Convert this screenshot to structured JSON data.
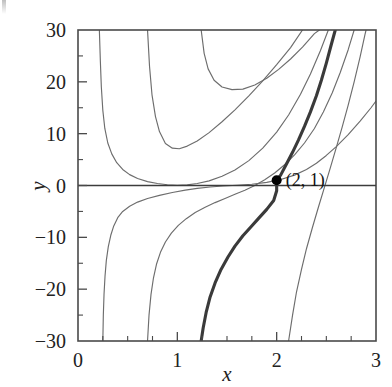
{
  "chart_data": {
    "type": "line",
    "title": "",
    "subtitle": "",
    "xlabel": "x",
    "ylabel": "y",
    "xlim": [
      0,
      3
    ],
    "ylim": [
      -30,
      30
    ],
    "grid": false,
    "legend": null,
    "x_ticks": [
      0,
      1,
      2,
      3
    ],
    "x_tick_labels": [
      "0",
      "1",
      "2",
      "3"
    ],
    "y_ticks": [
      -30,
      -20,
      -10,
      0,
      10,
      20,
      30
    ],
    "y_tick_labels": [
      "−30",
      "−20",
      "−10",
      "0",
      "10",
      "20",
      "30"
    ],
    "x_minor_ticks": [
      0.25,
      0.5,
      0.75,
      1.25,
      1.5,
      1.75,
      2.25,
      2.5,
      2.75
    ],
    "y_minor_ticks": [
      -25,
      -15,
      -5,
      5,
      15,
      25
    ],
    "zero_line": 0,
    "annotations": [
      {
        "text": "(2, 1)",
        "x": 2,
        "y": 1,
        "marker": "filled-circle"
      }
    ],
    "series": [
      {
        "name": "solution-curve-1",
        "emphasis": "normal",
        "points": [
          [
            0.215,
            30
          ],
          [
            0.225,
            24
          ],
          [
            0.235,
            19
          ],
          [
            0.25,
            14.5
          ],
          [
            0.27,
            11
          ],
          [
            0.3,
            8.2
          ],
          [
            0.34,
            6.1
          ],
          [
            0.39,
            4.4
          ],
          [
            0.45,
            3.1
          ],
          [
            0.52,
            2.1
          ],
          [
            0.6,
            1.35
          ],
          [
            0.7,
            0.75
          ],
          [
            0.8,
            0.38
          ],
          [
            0.9,
            0.15
          ],
          [
            1.0,
            0.05
          ],
          [
            1.1,
            0.12
          ],
          [
            1.2,
            0.38
          ],
          [
            1.32,
            0.9
          ],
          [
            1.45,
            1.8
          ],
          [
            1.58,
            3.0
          ],
          [
            1.72,
            4.8
          ],
          [
            1.86,
            7.2
          ],
          [
            2.0,
            10.3
          ],
          [
            2.12,
            13.6
          ],
          [
            2.24,
            17.6
          ],
          [
            2.34,
            21.5
          ],
          [
            2.44,
            26.0
          ],
          [
            2.52,
            30
          ]
        ]
      },
      {
        "name": "solution-curve-2",
        "emphasis": "normal",
        "points": [
          [
            0.7,
            30
          ],
          [
            0.72,
            23
          ],
          [
            0.745,
            17.5
          ],
          [
            0.78,
            13.3
          ],
          [
            0.82,
            10.4
          ],
          [
            0.88,
            8.1
          ],
          [
            0.95,
            7.2
          ],
          [
            1.02,
            7.1
          ],
          [
            1.1,
            7.6
          ],
          [
            1.2,
            8.6
          ],
          [
            1.32,
            10.2
          ],
          [
            1.45,
            12.3
          ],
          [
            1.58,
            14.6
          ],
          [
            1.72,
            17.3
          ],
          [
            1.86,
            20.2
          ],
          [
            2.0,
            23.3
          ],
          [
            2.14,
            26.6
          ],
          [
            2.26,
            30
          ]
        ]
      },
      {
        "name": "solution-curve-3",
        "emphasis": "normal",
        "points": [
          [
            1.24,
            30
          ],
          [
            1.27,
            25.5
          ],
          [
            1.31,
            22.5
          ],
          [
            1.37,
            20.3
          ],
          [
            1.45,
            19.0
          ],
          [
            1.55,
            18.5
          ],
          [
            1.66,
            18.6
          ],
          [
            1.78,
            19.4
          ],
          [
            1.9,
            20.7
          ],
          [
            2.02,
            22.4
          ],
          [
            2.14,
            24.4
          ],
          [
            2.26,
            26.7
          ],
          [
            2.38,
            29.3
          ],
          [
            2.43,
            30
          ]
        ]
      },
      {
        "name": "solution-curve-4",
        "emphasis": "normal",
        "points": [
          [
            0.25,
            -30
          ],
          [
            0.255,
            -25
          ],
          [
            0.262,
            -21
          ],
          [
            0.272,
            -17.5
          ],
          [
            0.285,
            -14.5
          ],
          [
            0.305,
            -11.8
          ],
          [
            0.33,
            -9.6
          ],
          [
            0.36,
            -7.8
          ],
          [
            0.4,
            -6.2
          ],
          [
            0.45,
            -5.0
          ],
          [
            0.52,
            -4.0
          ],
          [
            0.6,
            -3.2
          ],
          [
            0.7,
            -2.5
          ],
          [
            0.82,
            -1.9
          ],
          [
            0.95,
            -1.35
          ],
          [
            1.08,
            -0.9
          ],
          [
            1.2,
            -0.55
          ],
          [
            1.33,
            -0.28
          ],
          [
            1.46,
            -0.1
          ],
          [
            1.6,
            0.05
          ],
          [
            1.75,
            0.25
          ],
          [
            1.9,
            0.6
          ],
          [
            2.05,
            1.2
          ],
          [
            2.18,
            2.0
          ],
          [
            2.3,
            3.1
          ],
          [
            2.4,
            4.3
          ],
          [
            2.5,
            5.8
          ],
          [
            2.6,
            7.5
          ],
          [
            2.72,
            9.8
          ],
          [
            2.84,
            12.4
          ],
          [
            2.95,
            15.0
          ],
          [
            3.0,
            16.3
          ]
        ]
      },
      {
        "name": "solution-curve-5",
        "emphasis": "normal",
        "points": [
          [
            0.7,
            -30
          ],
          [
            0.715,
            -25
          ],
          [
            0.735,
            -21
          ],
          [
            0.76,
            -17.8
          ],
          [
            0.79,
            -15.2
          ],
          [
            0.83,
            -12.9
          ],
          [
            0.88,
            -10.9
          ],
          [
            0.94,
            -9.2
          ],
          [
            1.01,
            -7.7
          ],
          [
            1.09,
            -6.4
          ],
          [
            1.18,
            -5.2
          ],
          [
            1.28,
            -4.2
          ],
          [
            1.38,
            -3.3
          ],
          [
            1.48,
            -2.5
          ],
          [
            1.58,
            -1.7
          ],
          [
            1.68,
            -0.9
          ],
          [
            1.78,
            0.0
          ],
          [
            1.88,
            1.1
          ],
          [
            1.98,
            2.4
          ],
          [
            2.08,
            4.0
          ],
          [
            2.18,
            5.9
          ],
          [
            2.28,
            8.2
          ],
          [
            2.38,
            11.0
          ],
          [
            2.47,
            14.2
          ],
          [
            2.56,
            17.9
          ],
          [
            2.64,
            21.8
          ],
          [
            2.72,
            26.2
          ],
          [
            2.78,
            30
          ]
        ]
      },
      {
        "name": "solution-curve-6",
        "emphasis": "normal",
        "points": [
          [
            2.12,
            -30
          ],
          [
            2.16,
            -25
          ],
          [
            2.2,
            -20.5
          ],
          [
            2.25,
            -16.2
          ],
          [
            2.3,
            -12.2
          ],
          [
            2.36,
            -8.1
          ],
          [
            2.42,
            -4.2
          ],
          [
            2.48,
            -0.4
          ],
          [
            2.54,
            3.4
          ],
          [
            2.6,
            7.3
          ],
          [
            2.66,
            11.3
          ],
          [
            2.72,
            15.5
          ],
          [
            2.78,
            20.0
          ],
          [
            2.84,
            24.8
          ],
          [
            2.89,
            29.2
          ],
          [
            2.9,
            30
          ]
        ]
      },
      {
        "name": "solution-curve-through-point",
        "emphasis": "bold",
        "points": [
          [
            1.24,
            -30
          ],
          [
            1.26,
            -27.5
          ],
          [
            1.29,
            -24.5
          ],
          [
            1.33,
            -21.5
          ],
          [
            1.38,
            -18.8
          ],
          [
            1.44,
            -16.2
          ],
          [
            1.51,
            -13.8
          ],
          [
            1.58,
            -11.7
          ],
          [
            1.66,
            -9.7
          ],
          [
            1.74,
            -8.0
          ],
          [
            1.82,
            -6.3
          ],
          [
            1.9,
            -4.6
          ],
          [
            1.97,
            -2.9
          ],
          [
            2.0,
            -1.0
          ],
          [
            2.0,
            1.0
          ],
          [
            2.04,
            2.0
          ],
          [
            2.1,
            4.2
          ],
          [
            2.16,
            6.4
          ],
          [
            2.22,
            8.8
          ],
          [
            2.28,
            11.4
          ],
          [
            2.34,
            14.2
          ],
          [
            2.4,
            17.3
          ],
          [
            2.45,
            20.3
          ],
          [
            2.5,
            23.6
          ],
          [
            2.55,
            27.2
          ],
          [
            2.59,
            30
          ]
        ]
      }
    ]
  }
}
